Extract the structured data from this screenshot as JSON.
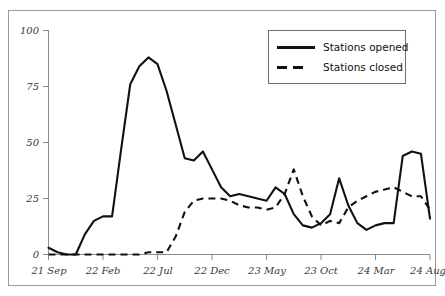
{
  "chart_data": {
    "type": "line",
    "title": "",
    "xlabel": "",
    "ylabel": "",
    "ylim": [
      0,
      100
    ],
    "yticks": [
      0,
      25,
      50,
      75,
      100
    ],
    "xticks": [
      "21 Sep",
      "22 Feb",
      "22 Jul",
      "22 Dec",
      "23 May",
      "23 Oct",
      "24 Mar",
      "24 Aug"
    ],
    "grid": false,
    "legend_position": "top-right",
    "x": [
      "21 Sep",
      "21 Oct",
      "21 Nov",
      "21 Dec",
      "22 Jan",
      "22 Feb",
      "22 Mar",
      "22 Apr",
      "22 May",
      "22 Jun",
      "22 Jul",
      "22 Aug",
      "22 Sep",
      "22 Oct",
      "22 Nov",
      "22 Dec",
      "23 Jan",
      "23 Feb",
      "23 Mar",
      "23 Apr",
      "23 May",
      "23 Jun",
      "23 Jul",
      "23 Aug",
      "23 Sep",
      "23 Oct",
      "23 Nov",
      "23 Dec",
      "24 Jan",
      "24 Feb",
      "24 Mar",
      "24 Apr",
      "24 May",
      "24 Jun",
      "24 Jul",
      "24 Aug"
    ],
    "series": [
      {
        "name": "Stations opened",
        "style": "solid",
        "values": [
          3,
          1,
          0,
          0,
          9,
          15,
          17,
          17,
          47,
          76,
          84,
          88,
          85,
          73,
          58,
          43,
          42,
          46,
          38,
          30,
          26,
          27,
          26,
          25,
          24,
          30,
          27,
          18,
          13,
          12,
          14,
          18,
          34,
          22,
          14,
          11
        ]
      },
      {
        "name": "Stations closed",
        "style": "dashed",
        "values": [
          0,
          0,
          0,
          0,
          0,
          0,
          0,
          0,
          0,
          0,
          0,
          1,
          1,
          1,
          8,
          19,
          24,
          25,
          25,
          25,
          24,
          22,
          21,
          21,
          20,
          21,
          27,
          38,
          26,
          17,
          13,
          15,
          14,
          21,
          24,
          26
        ]
      }
    ],
    "series_tail": [
      {
        "name": "Stations opened",
        "values": [
          11,
          13,
          14,
          14,
          44,
          46,
          45,
          16
        ]
      },
      {
        "name": "Stations closed",
        "values": [
          26,
          28,
          29,
          30,
          28,
          26,
          26,
          20
        ]
      }
    ]
  },
  "legend": {
    "items": [
      {
        "label": "Stations opened",
        "style": "solid"
      },
      {
        "label": "Stations closed",
        "style": "dashed"
      }
    ]
  },
  "axes": {
    "y_tick_labels": [
      "100",
      "75",
      "50",
      "25",
      "0"
    ],
    "x_tick_labels": [
      "21 Sep",
      "22 Feb",
      "22 Jul",
      "22 Dec",
      "23 May",
      "23 Oct",
      "24 Mar",
      "24 Aug"
    ]
  },
  "colors": {
    "line": "#111111",
    "axis": "#8c8c8c",
    "frame": "#9a9a9a",
    "background": "#ffffff"
  }
}
